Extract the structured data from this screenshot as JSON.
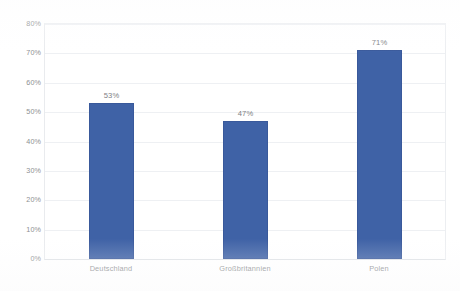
{
  "chart_data": {
    "type": "bar",
    "title": "",
    "subtitle": "",
    "xlabel": "",
    "ylabel": "",
    "categories": [
      "Deutschland",
      "Großbritannien",
      "Polen"
    ],
    "values": [
      53,
      47,
      71
    ],
    "value_labels": [
      "53%",
      "47%",
      "71%"
    ],
    "ylim": [
      0,
      80
    ],
    "y_tick_labels": [
      "80%",
      "70%",
      "60%",
      "50%",
      "40%",
      "30%",
      "20%",
      "10%",
      "0%"
    ],
    "y_tick_values": [
      80,
      70,
      60,
      50,
      40,
      30,
      20,
      10,
      0
    ],
    "grid": true,
    "legend": false,
    "legend_position": "none",
    "series": [
      {
        "name": "",
        "values": [
          53,
          47,
          71
        ],
        "color": "#3f62a6"
      }
    ],
    "colors": {
      "bar": "#3f62a6",
      "gridline": "#eef0f3",
      "axis": "#dcdfe3",
      "tick_text": "#8d8f92",
      "value_text": "#7e8084",
      "background": "#ffffff"
    }
  },
  "footer": {
    "cropped_caption": ""
  }
}
